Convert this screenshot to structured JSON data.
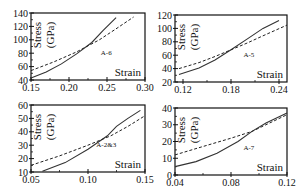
{
  "chart_data": [
    {
      "type": "line",
      "id": "A-6",
      "annotation": "A-6",
      "xlabel": "Strain",
      "ylabel": "Stress (GPa)",
      "xlim": [
        0.15,
        0.3
      ],
      "ylim": [
        40,
        140
      ],
      "xticks": [
        "0.15",
        "0.20",
        "0.25",
        "0.30"
      ],
      "yticks": [
        "40",
        "60",
        "80",
        "100",
        "120",
        "140"
      ],
      "grid": false,
      "frame": {
        "x0": 31,
        "y0": 13,
        "x1": 145,
        "y1": 80
      },
      "series": [
        {
          "name": "solid",
          "style": "solid",
          "x": [
            0.15,
            0.17,
            0.19,
            0.21,
            0.23,
            0.245,
            0.262
          ],
          "y": [
            43,
            52,
            64,
            79,
            96,
            114,
            133
          ]
        },
        {
          "name": "dashed",
          "style": "dashed",
          "x": [
            0.15,
            0.18,
            0.21,
            0.24,
            0.26,
            0.285
          ],
          "y": [
            54,
            67,
            82,
            100,
            115,
            134
          ]
        }
      ]
    },
    {
      "type": "line",
      "id": "A-5",
      "annotation": "A-5",
      "xlabel": "Strain",
      "ylabel": "Stress (GPa)",
      "xlim": [
        0.11,
        0.25
      ],
      "ylim": [
        20,
        120
      ],
      "xticks": [
        "0.12",
        "0.18",
        "0.24"
      ],
      "yticks": [
        "20",
        "40",
        "60",
        "80",
        "100",
        "120"
      ],
      "grid": false,
      "frame": {
        "x0": 175,
        "y0": 15,
        "x1": 287,
        "y1": 82
      },
      "series": [
        {
          "name": "solid",
          "style": "solid",
          "x": [
            0.115,
            0.14,
            0.16,
            0.18,
            0.2,
            0.22,
            0.24
          ],
          "y": [
            31,
            41,
            53,
            68,
            84,
            100,
            112
          ]
        },
        {
          "name": "dashed",
          "style": "dashed",
          "x": [
            0.115,
            0.14,
            0.16,
            0.18,
            0.2,
            0.22,
            0.25
          ],
          "y": [
            40,
            49,
            58,
            68,
            78,
            89,
            105
          ]
        }
      ]
    },
    {
      "type": "line",
      "id": "A-2&3",
      "annotation": "A-2&3",
      "xlabel": "Strain",
      "ylabel": "Stress (GPa)",
      "xlim": [
        0.05,
        0.15
      ],
      "ylim": [
        10,
        60
      ],
      "xticks": [
        "0.05",
        "0.10",
        "0.15"
      ],
      "yticks": [
        "10",
        "20",
        "30",
        "40",
        "50",
        "60"
      ],
      "grid": false,
      "frame": {
        "x0": 31,
        "y0": 105,
        "x1": 145,
        "y1": 172
      },
      "series": [
        {
          "name": "solid",
          "style": "solid",
          "x": [
            0.06,
            0.08,
            0.1,
            0.117,
            0.125,
            0.135,
            0.146
          ],
          "y": [
            10.5,
            17,
            27,
            37,
            44,
            50,
            56
          ]
        },
        {
          "name": "dashed",
          "style": "dashed",
          "x": [
            0.05,
            0.075,
            0.1,
            0.12,
            0.135,
            0.15
          ],
          "y": [
            15,
            22,
            30,
            37,
            44,
            52
          ]
        }
      ]
    },
    {
      "type": "line",
      "id": "A-7",
      "annotation": "A-7",
      "xlabel": "Strain",
      "ylabel": "Stress (GPa)",
      "xlim": [
        0.04,
        0.12
      ],
      "ylim": [
        0,
        40
      ],
      "xticks": [
        "0.04",
        "0.08",
        "0.12"
      ],
      "yticks": [
        "0",
        "10",
        "20",
        "30",
        "40"
      ],
      "grid": false,
      "frame": {
        "x0": 175,
        "y0": 108,
        "x1": 287,
        "y1": 175
      },
      "series": [
        {
          "name": "solid",
          "style": "solid",
          "x": [
            0.04,
            0.055,
            0.07,
            0.085,
            0.095,
            0.105,
            0.12
          ],
          "y": [
            5,
            8,
            13,
            20,
            26,
            31,
            37
          ]
        },
        {
          "name": "dashed",
          "style": "dashed",
          "x": [
            0.04,
            0.06,
            0.08,
            0.095,
            0.11,
            0.12
          ],
          "y": [
            12,
            17,
            22,
            26,
            32,
            36
          ]
        }
      ]
    }
  ]
}
